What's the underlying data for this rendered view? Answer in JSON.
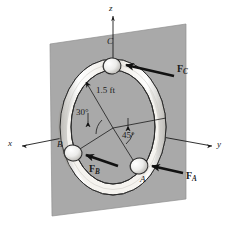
{
  "figure": {
    "plane_color": "#a9a9a9",
    "ring_color": "#f2f0ec",
    "ring_shade": "#c9c7c2",
    "line_color": "#1a1a1a",
    "background": "#ffffff"
  },
  "axes": [
    {
      "name": "x-axis",
      "label": "x",
      "x": 8,
      "y": 140
    },
    {
      "name": "y-axis",
      "label": "y",
      "x": 218,
      "y": 142
    },
    {
      "name": "z-axis",
      "label": "z",
      "x": 109,
      "y": 5
    }
  ],
  "points": [
    {
      "name": "point-c",
      "label": "C",
      "x": 108,
      "y": 42
    },
    {
      "name": "point-b",
      "label": "B",
      "x": 58,
      "y": 140
    },
    {
      "name": "point-a",
      "label": "A",
      "x": 141,
      "y": 178
    }
  ],
  "forces": [
    {
      "name": "force-c",
      "label": "F",
      "sub": "C",
      "x": 178,
      "y": 69
    },
    {
      "name": "force-b",
      "label": "F",
      "sub": "B",
      "x": 90,
      "y": 169
    },
    {
      "name": "force-a",
      "label": "F",
      "sub": "A",
      "x": 187,
      "y": 176
    }
  ],
  "annotations": [
    {
      "name": "radius-dimension",
      "label": "1.5 ft",
      "x": 97,
      "y": 92
    },
    {
      "name": "angle-30",
      "label": "30°",
      "x": 78,
      "y": 114
    },
    {
      "name": "angle-45",
      "label": "45°",
      "x": 123,
      "y": 137
    }
  ]
}
